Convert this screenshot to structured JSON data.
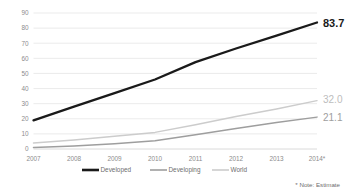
{
  "chart_data": {
    "type": "line",
    "title": "",
    "subtitle": "",
    "xlabel": "",
    "ylabel": "",
    "categories": [
      "2007",
      "2008",
      "2009",
      "2010",
      "2011",
      "2012",
      "2013",
      "2014*"
    ],
    "ylim": [
      0,
      90
    ],
    "ytick_step": 10,
    "yticks": [
      "0",
      "10",
      "20",
      "30",
      "40",
      "50",
      "60",
      "70",
      "80",
      "90"
    ],
    "grid": true,
    "legend_position": "bottom",
    "series": [
      {
        "name": "Developed",
        "color": "#1a1a1a",
        "values": [
          19.0,
          28.0,
          37.0,
          46.0,
          57.5,
          66.5,
          75.0,
          83.7
        ],
        "end_label": "83.7"
      },
      {
        "name": "Developing",
        "color": "#9e9e9e",
        "values": [
          1.0,
          2.0,
          3.5,
          5.5,
          9.5,
          13.5,
          17.5,
          21.1
        ],
        "end_label": "21.1"
      },
      {
        "name": "World",
        "color": "#cccccc",
        "values": [
          4.0,
          6.0,
          8.5,
          11.0,
          16.0,
          21.5,
          26.5,
          32.0
        ],
        "end_label": "32.0"
      }
    ],
    "annotations": [
      {
        "text": "* Note: Estimate"
      }
    ]
  },
  "legend": {
    "items": [
      {
        "label": "Developed",
        "color": "#1a1a1a"
      },
      {
        "label": "Developing",
        "color": "#9e9e9e"
      },
      {
        "label": "World",
        "color": "#cccccc"
      }
    ]
  },
  "footnote": {
    "text": "* Note: Estimate"
  },
  "colors": {
    "developed": "#1a1a1a",
    "developing": "#9e9e9e",
    "world": "#cccccc",
    "gridline": "#e3e3e3",
    "tick_text": "#8c8c8c",
    "background": "#ffffff"
  }
}
